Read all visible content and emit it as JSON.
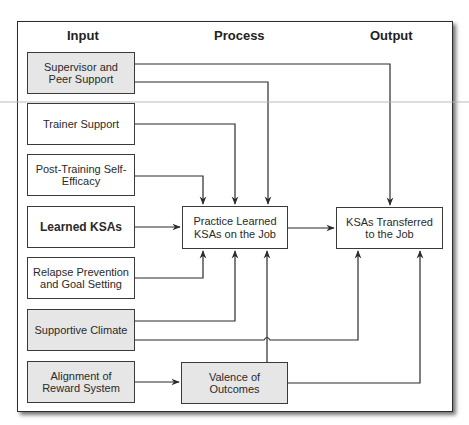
{
  "diagram": {
    "columns": {
      "input": "Input",
      "process": "Process",
      "output": "Output"
    },
    "inputs": [
      {
        "id": "supervisor",
        "label": "Supervisor and Peer Support",
        "shaded": true
      },
      {
        "id": "trainer",
        "label": "Trainer Support",
        "shaded": false
      },
      {
        "id": "self_efficacy",
        "label": "Post-Training Self-Efficacy",
        "shaded": false
      },
      {
        "id": "learned",
        "label": "Learned KSAs",
        "shaded": false,
        "bold": true
      },
      {
        "id": "relapse",
        "label": "Relapse Prevention and Goal Setting",
        "shaded": false
      },
      {
        "id": "climate",
        "label": "Supportive Climate",
        "shaded": true
      },
      {
        "id": "reward",
        "label": "Alignment of Reward System",
        "shaded": true
      }
    ],
    "process": [
      {
        "id": "practice",
        "label": "Practice Learned KSAs on the Job",
        "shaded": false
      },
      {
        "id": "valence",
        "label": "Valence of Outcomes",
        "shaded": true
      }
    ],
    "outputs": [
      {
        "id": "transferred",
        "label": "KSAs Transferred to the Job",
        "shaded": false
      }
    ],
    "edges": [
      {
        "from": "supervisor",
        "to": "transferred"
      },
      {
        "from": "supervisor",
        "to": "practice"
      },
      {
        "from": "trainer",
        "to": "practice"
      },
      {
        "from": "self_efficacy",
        "to": "practice"
      },
      {
        "from": "learned",
        "to": "practice"
      },
      {
        "from": "relapse",
        "to": "practice"
      },
      {
        "from": "climate",
        "to": "practice"
      },
      {
        "from": "climate",
        "to": "transferred"
      },
      {
        "from": "reward",
        "to": "valence"
      },
      {
        "from": "valence",
        "to": "practice"
      },
      {
        "from": "valence",
        "to": "transferred"
      },
      {
        "from": "practice",
        "to": "transferred"
      }
    ],
    "colors": {
      "line": "#2b2b2b",
      "shaded_fill": "#e6e6e6",
      "plain_fill": "#ffffff"
    }
  }
}
